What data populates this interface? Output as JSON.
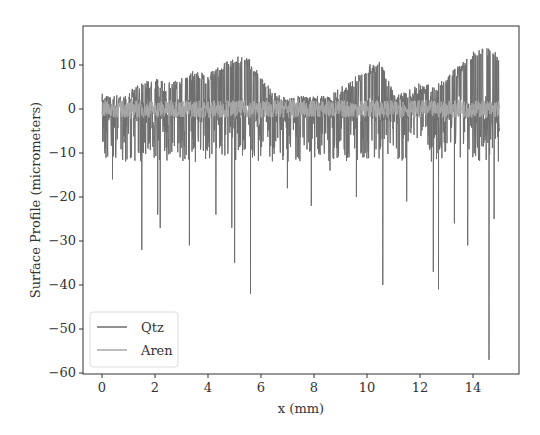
{
  "chart_data": {
    "type": "line",
    "title": "",
    "xlabel": "x (mm)",
    "ylabel": "Surface Profile (micrometers)",
    "xlim": [
      -0.7,
      15.75
    ],
    "ylim": [
      -60,
      15.5
    ],
    "xticks": [
      0,
      2,
      4,
      6,
      8,
      10,
      12,
      14
    ],
    "yticks": [
      10,
      0,
      -10,
      -20,
      -30,
      -40,
      -50,
      -60
    ],
    "grid": false,
    "legend_position": "lower left",
    "series": [
      {
        "name": "Qtz",
        "color": "#6e6e6e",
        "x_range": [
          0,
          15
        ],
        "upper_envelope": {
          "x": [
            0,
            0.5,
            1,
            1.5,
            2,
            2.5,
            3,
            3.5,
            4,
            4.5,
            5,
            5.5,
            6,
            6.5,
            7,
            7.5,
            8,
            8.5,
            9,
            9.5,
            10,
            10.5,
            11,
            11.5,
            12,
            12.5,
            13,
            13.5,
            14,
            14.5,
            15
          ],
          "y": [
            4,
            3,
            4,
            6,
            7,
            6,
            7,
            9,
            8,
            10,
            12,
            12,
            8,
            4,
            3,
            3,
            3,
            3,
            5,
            7,
            10,
            11,
            4,
            4,
            6,
            6,
            8,
            10,
            13,
            14,
            13
          ]
        },
        "deep_spikes": [
          {
            "x": 0.4,
            "y": -16
          },
          {
            "x": 1.5,
            "y": -32
          },
          {
            "x": 2.1,
            "y": -24
          },
          {
            "x": 2.2,
            "y": -27
          },
          {
            "x": 3.3,
            "y": -31
          },
          {
            "x": 4.3,
            "y": -24
          },
          {
            "x": 4.9,
            "y": -27
          },
          {
            "x": 5.0,
            "y": -35
          },
          {
            "x": 5.6,
            "y": -42
          },
          {
            "x": 7.0,
            "y": -18
          },
          {
            "x": 7.9,
            "y": -22
          },
          {
            "x": 8.6,
            "y": -14
          },
          {
            "x": 9.6,
            "y": -20
          },
          {
            "x": 10.6,
            "y": -40
          },
          {
            "x": 11.5,
            "y": -21
          },
          {
            "x": 12.5,
            "y": -37
          },
          {
            "x": 12.7,
            "y": -41
          },
          {
            "x": 13.3,
            "y": -26
          },
          {
            "x": 13.8,
            "y": -31
          },
          {
            "x": 14.6,
            "y": -57
          },
          {
            "x": 14.8,
            "y": -25
          }
        ]
      },
      {
        "name": "Aren",
        "color": "#a8a8a8",
        "x_range": [
          0,
          15
        ],
        "baseline": 0,
        "noise_amplitude": 2
      }
    ]
  }
}
